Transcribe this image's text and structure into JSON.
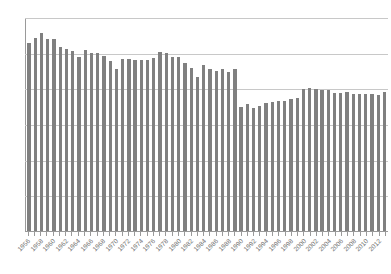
{
  "chart_data": {
    "type": "bar",
    "title": "",
    "subtitle": "",
    "xlabel": "",
    "ylabel": "",
    "ylim": [
      0,
      60
    ],
    "ytick_step": 10,
    "yticks": [
      "0",
      "10",
      "20",
      "30",
      "40",
      "50",
      "60"
    ],
    "grid": true,
    "legend": null,
    "bar_color": "#808080",
    "grid_color": "#c8c8c8",
    "axis_color": "#9a9a9a",
    "tick_label_color": "#6f6f6f",
    "xtick_label_interval": 2,
    "categories": [
      "1956",
      "1957",
      "1958",
      "1959",
      "1960",
      "1961",
      "1962",
      "1963",
      "1964",
      "1965",
      "1966",
      "1967",
      "1968",
      "1969",
      "1970",
      "1971",
      "1972",
      "1973",
      "1974",
      "1975",
      "1976",
      "1977",
      "1978",
      "1979",
      "1980",
      "1981",
      "1982",
      "1983",
      "1984",
      "1985",
      "1986",
      "1987",
      "1988",
      "1989",
      "1990",
      "1991",
      "1992",
      "1993",
      "1994",
      "1995",
      "1996",
      "1997",
      "1998",
      "1999",
      "2000",
      "2001",
      "2002",
      "2003",
      "2004",
      "2005",
      "2006",
      "2007",
      "2008",
      "2009",
      "2010",
      "2011",
      "2012",
      "2013"
    ],
    "values": [
      52.8,
      54.2,
      55.5,
      53.8,
      53.7,
      51.5,
      51.0,
      50.6,
      48.9,
      50.8,
      50.0,
      50.0,
      49.0,
      47.8,
      45.5,
      48.2,
      48.3,
      48.0,
      48.0,
      48.0,
      48.4,
      50.3,
      49.8,
      48.7,
      48.8,
      47.2,
      45.7,
      43.2,
      46.5,
      45.3,
      45.0,
      45.3,
      44.7,
      45.5,
      34.9,
      35.6,
      34.4,
      35.0,
      36.0,
      36.2,
      36.4,
      36.5,
      37.0,
      37.3,
      39.8,
      40.2,
      39.8,
      39.6,
      39.5,
      38.7,
      38.8,
      38.9,
      38.3,
      38.4,
      38.4,
      38.5,
      38.0,
      39.0
    ],
    "xtick_labels_shown": [
      "1956",
      "1958",
      "1960",
      "1962",
      "1964",
      "1966",
      "1968",
      "1970",
      "1972",
      "1974",
      "1976",
      "1978",
      "1980",
      "1982",
      "1984",
      "1986",
      "1988",
      "1990",
      "1992",
      "1994",
      "1996",
      "1998",
      "2000",
      "2002",
      "2004",
      "2006",
      "2008",
      "2010",
      "2012"
    ]
  }
}
